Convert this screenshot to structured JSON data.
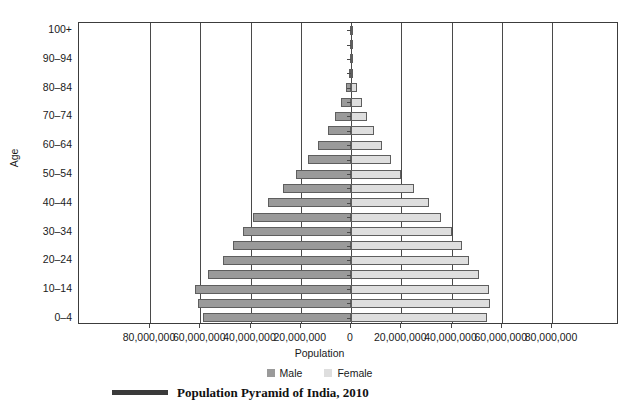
{
  "chart_data": {
    "type": "bar",
    "subtype": "population-pyramid",
    "title": "Population Pyramid of India, 2010",
    "xlabel": "Population",
    "ylabel": "Age",
    "grid": true,
    "legend_position": "bottom-center",
    "xlim": [
      -80000000,
      80000000
    ],
    "xticks": [
      -80000000,
      -60000000,
      -40000000,
      -20000000,
      0,
      20000000,
      40000000,
      60000000,
      80000000
    ],
    "xtick_labels": [
      "80,000,000",
      "60,000,000",
      "40,000,000",
      "20,000,000",
      "0",
      "20,000,000",
      "40,000,000",
      "60,000,000",
      "80,000,000"
    ],
    "categories": [
      "0–4",
      "5–9",
      "10–14",
      "15–19",
      "20–24",
      "25–29",
      "30–34",
      "35–39",
      "40–44",
      "45–49",
      "50–54",
      "55–59",
      "60–64",
      "65–69",
      "70–74",
      "75–79",
      "80–84",
      "85–89",
      "90–94",
      "95–99",
      "100+"
    ],
    "ytick_labels": [
      "0–4",
      "10–14",
      "20–24",
      "30–34",
      "40–44",
      "50–54",
      "60–64",
      "70–74",
      "80–84",
      "90–94",
      "100+"
    ],
    "series": [
      {
        "name": "Male",
        "color": "#9a9a9a",
        "values": [
          59000000,
          61000000,
          62000000,
          57000000,
          51000000,
          47000000,
          43000000,
          39000000,
          33000000,
          27000000,
          22000000,
          17000000,
          13000000,
          9000000,
          6500000,
          4000000,
          2000000,
          800000,
          250000,
          60000,
          10000
        ]
      },
      {
        "name": "Female",
        "color": "#dedede",
        "values": [
          54000000,
          55500000,
          55000000,
          51000000,
          47000000,
          44000000,
          40000000,
          36000000,
          31000000,
          25000000,
          20000000,
          16000000,
          12500000,
          9000000,
          6500000,
          4200000,
          2200000,
          900000,
          280000,
          70000,
          12000
        ]
      }
    ]
  },
  "legend": {
    "items": [
      {
        "label": "Male",
        "swatch": "male-swatch"
      },
      {
        "label": "Female",
        "swatch": "female-swatch"
      }
    ]
  },
  "caption": {
    "text": "Population Pyramid of India, 2010"
  }
}
